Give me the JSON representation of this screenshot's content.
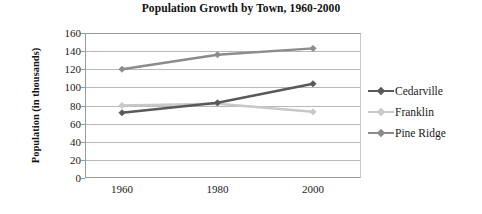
{
  "chart_data": {
    "type": "line",
    "title": "Population Growth by Town, 1960-2000",
    "xlabel": "",
    "ylabel": "Population (in thousands)",
    "categories": [
      "1960",
      "1980",
      "2000"
    ],
    "ylim": [
      0,
      160
    ],
    "yticks": [
      "0",
      "20",
      "40",
      "60",
      "80",
      "100",
      "120",
      "140",
      "160"
    ],
    "grid": true,
    "legend_position": "right",
    "series": [
      {
        "name": "Cedarville",
        "color": "#595959",
        "values": [
          72,
          83,
          104
        ]
      },
      {
        "name": "Franklin",
        "color": "#c8c8c8",
        "values": [
          80,
          82,
          73
        ]
      },
      {
        "name": "Pine Ridge",
        "color": "#8c8c8c",
        "values": [
          120,
          136,
          143
        ]
      }
    ]
  }
}
